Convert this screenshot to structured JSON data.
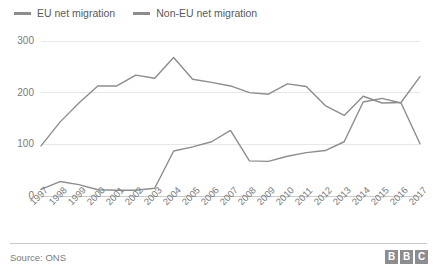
{
  "legend": {
    "position": "top-left",
    "items": [
      {
        "label": "EU net migration",
        "color": "#8c8d8f",
        "key": "eu"
      },
      {
        "label": "Non-EU net migration",
        "color": "#8c8d8f",
        "key": "non_eu"
      }
    ]
  },
  "footer": {
    "source": "Source: ONS",
    "logo": [
      "B",
      "B",
      "C"
    ]
  },
  "chart_data": {
    "type": "line",
    "title": "",
    "subtitle": "",
    "xlabel": "",
    "ylabel": "",
    "grid": true,
    "legend_position": "top-left",
    "ylim": [
      0,
      300
    ],
    "yticks": [
      0,
      100,
      200,
      300
    ],
    "categories": [
      "1997",
      "1998",
      "1999",
      "2000",
      "2001",
      "2002",
      "2003",
      "2004",
      "2005",
      "2006",
      "2007",
      "2008",
      "2009",
      "2010",
      "2011",
      "2012",
      "2013",
      "2014",
      "2015",
      "2016",
      "2017"
    ],
    "series": [
      {
        "name": "EU net migration",
        "color": "#8c8d8f",
        "values": [
          13,
          28,
          22,
          12,
          11,
          11,
          15,
          87,
          95,
          105,
          127,
          68,
          67,
          77,
          84,
          88,
          105,
          182,
          189,
          180,
          101
        ]
      },
      {
        "name": "Non-EU net migration",
        "color": "#8c8d8f",
        "values": [
          97,
          143,
          180,
          213,
          213,
          234,
          228,
          268,
          226,
          220,
          213,
          200,
          197,
          217,
          212,
          175,
          156,
          193,
          180,
          181,
          231
        ]
      }
    ]
  }
}
